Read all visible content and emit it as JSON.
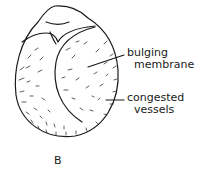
{
  "figure": {
    "panel_letter": "B",
    "line_color": "#1a1a1a",
    "background": "#ffffff"
  },
  "labels": {
    "bulging": {
      "line1": "bulging",
      "line2": "membrane"
    },
    "congested": {
      "line1": "congested",
      "line2": "vessels"
    }
  }
}
